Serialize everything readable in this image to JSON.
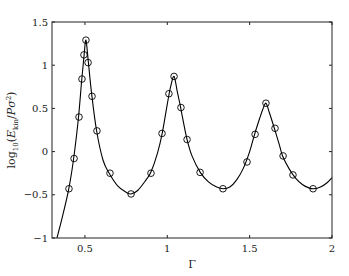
{
  "chart_data": {
    "type": "line",
    "title": "",
    "xlabel": "Γ",
    "ylabel": "log10(E_kin / Pσ²)",
    "ylabel_parts": {
      "prefix": "log",
      "sub": "10",
      "open": "(",
      "E": "E",
      "E_sub": "kin",
      "slash": "/",
      "P": "P",
      "sigma": "σ",
      "sq": "2",
      "close": ")"
    },
    "xlim": [
      0.3,
      2.0
    ],
    "ylim": [
      -1.0,
      1.5
    ],
    "xticks": [
      0.5,
      1,
      1.5,
      2
    ],
    "xtick_labels": [
      "0.5",
      "1",
      "1.5",
      "2"
    ],
    "yticks": [
      -1,
      -0.5,
      0,
      0.5,
      1,
      1.5
    ],
    "ytick_labels": [
      "−1",
      "−0.5",
      "0",
      "0.5",
      "1",
      "1.5"
    ],
    "grid": false,
    "legend": null,
    "series": [
      {
        "name": "model curve",
        "style": "solid line",
        "color": "#000000",
        "x": [
          0.33,
          0.36,
          0.4,
          0.43,
          0.46,
          0.48,
          0.495,
          0.506,
          0.52,
          0.54,
          0.57,
          0.61,
          0.65,
          0.7,
          0.75,
          0.78,
          0.82,
          0.87,
          0.9,
          0.94,
          0.97,
          1.0,
          1.02,
          1.041,
          1.06,
          1.08,
          1.1,
          1.12,
          1.15,
          1.2,
          1.25,
          1.3,
          1.34,
          1.38,
          1.42,
          1.46,
          1.5,
          1.53,
          1.56,
          1.58,
          1.599,
          1.62,
          1.65,
          1.68,
          1.7,
          1.74,
          1.78,
          1.82,
          1.86,
          1.89,
          1.93,
          1.97,
          2.0
        ],
        "y": [
          -1.0,
          -0.78,
          -0.45,
          -0.1,
          0.38,
          0.82,
          1.12,
          1.29,
          1.05,
          0.68,
          0.25,
          -0.1,
          -0.26,
          -0.4,
          -0.47,
          -0.49,
          -0.45,
          -0.33,
          -0.24,
          -0.02,
          0.22,
          0.55,
          0.75,
          0.87,
          0.7,
          0.52,
          0.32,
          0.14,
          -0.05,
          -0.24,
          -0.35,
          -0.41,
          -0.43,
          -0.41,
          -0.33,
          -0.2,
          0.0,
          0.2,
          0.38,
          0.49,
          0.56,
          0.45,
          0.27,
          0.08,
          -0.05,
          -0.2,
          -0.31,
          -0.38,
          -0.42,
          -0.43,
          -0.41,
          -0.36,
          -0.3
        ]
      },
      {
        "name": "simulation data",
        "style": "open circle markers",
        "color": "#000000",
        "x": [
          0.403,
          0.434,
          0.464,
          0.482,
          0.494,
          0.506,
          0.519,
          0.543,
          0.573,
          0.652,
          0.78,
          0.901,
          0.968,
          1.01,
          1.041,
          1.083,
          1.12,
          1.199,
          1.338,
          1.484,
          1.533,
          1.599,
          1.654,
          1.703,
          1.763,
          1.885
        ],
        "y": [
          -0.43,
          -0.08,
          0.4,
          0.84,
          1.12,
          1.29,
          1.03,
          0.64,
          0.24,
          -0.25,
          -0.49,
          -0.25,
          0.21,
          0.67,
          0.87,
          0.51,
          0.14,
          -0.24,
          -0.43,
          -0.12,
          0.2,
          0.56,
          0.27,
          -0.05,
          -0.27,
          -0.43
        ]
      }
    ]
  }
}
